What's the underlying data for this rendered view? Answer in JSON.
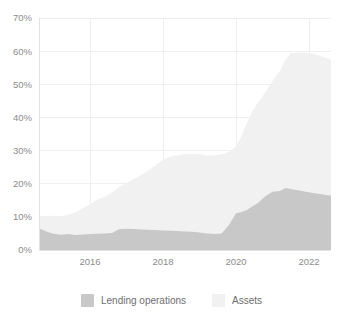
{
  "chart_data": {
    "type": "area",
    "title": "",
    "subtitle": "",
    "xlabel": "",
    "ylabel": "",
    "stacked": false,
    "grid": true,
    "legend_position": "bottom",
    "xlim": [
      2014.6,
      2022.6
    ],
    "ylim": [
      0,
      70
    ],
    "y_ticks": [
      0,
      10,
      20,
      30,
      40,
      50,
      60,
      70
    ],
    "y_tick_labels": [
      "0%",
      "10%",
      "20%",
      "30%",
      "40%",
      "50%",
      "60%",
      "70%"
    ],
    "x_ticks": [
      2016,
      2018,
      2020,
      2022
    ],
    "x_tick_labels": [
      "2016",
      "2018",
      "2020",
      "2022"
    ],
    "series": [
      {
        "name": "Assets",
        "color": "#f1f1f1",
        "x": [
          2014.6,
          2014.8,
          2015.0,
          2015.2,
          2015.4,
          2015.6,
          2015.8,
          2016.0,
          2016.2,
          2016.4,
          2016.6,
          2016.8,
          2017.0,
          2017.2,
          2017.4,
          2017.6,
          2017.8,
          2018.0,
          2018.2,
          2018.4,
          2018.6,
          2018.8,
          2019.0,
          2019.2,
          2019.4,
          2019.6,
          2019.8,
          2020.0,
          2020.15,
          2020.3,
          2020.45,
          2020.6,
          2020.8,
          2021.0,
          2021.2,
          2021.35,
          2021.5,
          2021.7,
          2021.9,
          2022.1,
          2022.3,
          2022.45,
          2022.6
        ],
        "values": [
          10.2,
          9.9,
          10.4,
          10.0,
          10.6,
          11.4,
          12.6,
          13.8,
          15.2,
          16.0,
          17.4,
          19.0,
          20.2,
          21.4,
          22.6,
          24.0,
          25.6,
          27.2,
          28.2,
          28.6,
          28.9,
          29.0,
          28.9,
          28.6,
          28.6,
          28.8,
          29.6,
          31.2,
          34.5,
          38.5,
          42.0,
          44.5,
          47.5,
          51.0,
          54.0,
          57.5,
          59.4,
          59.6,
          59.5,
          59.2,
          58.6,
          58.0,
          57.4
        ]
      },
      {
        "name": "Lending operations",
        "color": "#c8c8c8",
        "x": [
          2014.6,
          2014.8,
          2015.0,
          2015.2,
          2015.4,
          2015.6,
          2015.8,
          2016.0,
          2016.2,
          2016.4,
          2016.6,
          2016.8,
          2017.0,
          2017.2,
          2017.4,
          2017.6,
          2017.8,
          2018.0,
          2018.2,
          2018.4,
          2018.6,
          2018.8,
          2019.0,
          2019.2,
          2019.4,
          2019.6,
          2019.8,
          2020.0,
          2020.15,
          2020.3,
          2020.45,
          2020.6,
          2020.8,
          2021.0,
          2021.2,
          2021.35,
          2021.5,
          2021.7,
          2021.9,
          2022.1,
          2022.3,
          2022.45,
          2022.6
        ],
        "values": [
          6.6,
          5.6,
          4.9,
          4.6,
          4.8,
          4.5,
          4.7,
          4.8,
          4.9,
          5.0,
          5.1,
          6.3,
          6.4,
          6.3,
          6.2,
          6.1,
          6.0,
          5.9,
          5.8,
          5.7,
          5.6,
          5.5,
          5.3,
          5.0,
          4.8,
          5.0,
          7.5,
          11.1,
          11.5,
          12.1,
          13.2,
          14.2,
          16.2,
          17.6,
          17.8,
          18.7,
          18.4,
          18.0,
          17.6,
          17.2,
          16.9,
          16.6,
          16.4
        ]
      }
    ],
    "legend": [
      {
        "label": "Lending operations",
        "color": "#c8c8c8",
        "swatch_name": "legend-swatch-lending-operations"
      },
      {
        "label": "Assets",
        "color": "#f1f1f1",
        "swatch_name": "legend-swatch-assets"
      }
    ]
  },
  "plot": {
    "left": 39,
    "top": 18,
    "right": 331,
    "bottom": 250
  }
}
